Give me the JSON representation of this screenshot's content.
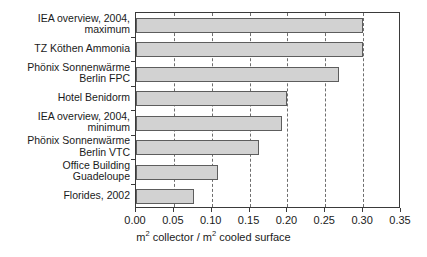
{
  "chart_data": {
    "type": "bar",
    "orientation": "horizontal",
    "title": "",
    "xlabel": "m2 collector / m2 cooled surface",
    "ylabel": "",
    "xlim": [
      0.0,
      0.35
    ],
    "xticks": [
      "0.00",
      "0.05",
      "0.10",
      "0.15",
      "0.20",
      "0.25",
      "0.30",
      "0.35"
    ],
    "xtick_values": [
      0.0,
      0.05,
      0.1,
      0.15,
      0.2,
      0.25,
      0.3,
      0.35
    ],
    "grid": "vertical dashed gridlines at each tick",
    "legend": "none",
    "bar_color": "#d2d2d2",
    "bar_edge_color": "#5d5d5d",
    "categories": [
      "IEA overview, 2004,\nmaximum",
      "TZ Köthen Ammonia",
      "Phönix Sonnenwärme\nBerlin FPC",
      "Hotel Benidorm",
      "IEA overview, 2004,\nminimum",
      "Phönix Sonnenwärme\nBerlin VTC",
      "Office Building\nGuadeloupe",
      "Florides, 2002"
    ],
    "values": [
      0.3,
      0.3,
      0.268,
      0.2,
      0.193,
      0.163,
      0.108,
      0.077
    ]
  },
  "axis": {
    "title_prefix": "m",
    "title_sup1": "2",
    "title_mid": " collector / m",
    "title_sup2": "2",
    "title_suffix": " cooled surface"
  }
}
